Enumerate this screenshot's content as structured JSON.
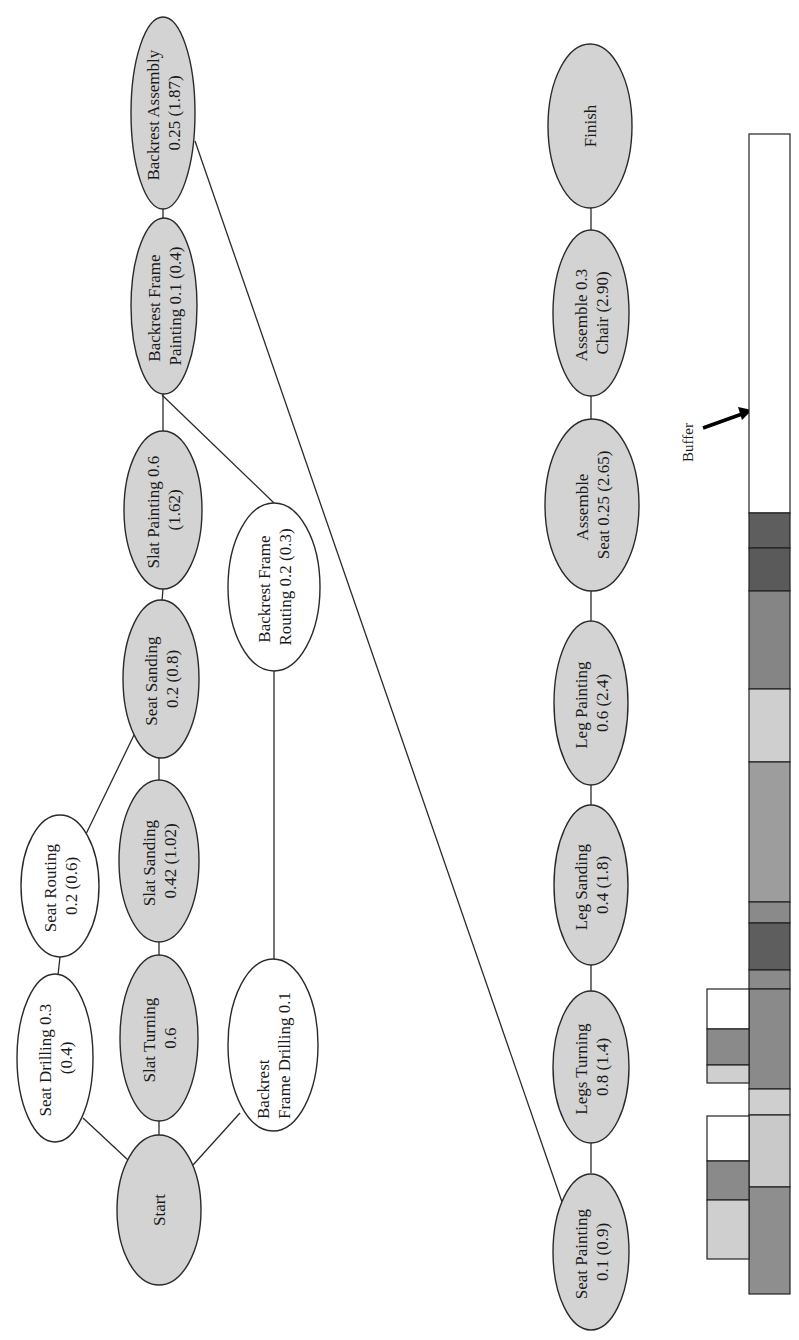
{
  "colors": {
    "critical_node_fill": "#d3d3d3",
    "noncritical_node_fill": "#ffffff",
    "edge": "#2a2a2a",
    "bar_dark": "#5e5e5e",
    "bar_mid": "#8a8a8a",
    "bar_midlight": "#9d9d9d",
    "bar_light": "#cfcfcf",
    "bar_white": "#ffffff"
  },
  "nodes": {
    "start": {
      "lines": [
        "Start"
      ],
      "critical": true
    },
    "seat_drilling": {
      "lines": [
        "Seat Drilling 0.3",
        "(0.4)"
      ],
      "critical": false
    },
    "slat_turning": {
      "lines": [
        "Slat Turning",
        "0.6"
      ],
      "critical": true
    },
    "backrest_frame_drilling": {
      "lines": [
        "Backrest",
        "Frame Drilling 0.1"
      ],
      "critical": false
    },
    "seat_routing": {
      "lines": [
        "Seat Routing",
        "0.2 (0.6)"
      ],
      "critical": false
    },
    "slat_sanding": {
      "lines": [
        "Slat Sanding",
        "0.42 (1.02)"
      ],
      "critical": true
    },
    "seat_sanding": {
      "lines": [
        "Seat Sanding",
        "0.2 (0.8)"
      ],
      "critical": true
    },
    "slat_painting": {
      "lines": [
        "Slat Painting 0.6",
        "(1.62)"
      ],
      "critical": true
    },
    "backrest_frame_routing": {
      "lines": [
        "Backrest Frame",
        "Routing 0.2 (0.3)"
      ],
      "critical": false
    },
    "backrest_frame_painting": {
      "lines": [
        "Backrest Frame",
        "Painting 0.1 (0.4)"
      ],
      "critical": true
    },
    "backrest_assembly": {
      "lines": [
        "Backrest Assembly",
        "0.25 (1.87)"
      ],
      "critical": true
    },
    "seat_painting": {
      "lines": [
        "Seat Painting",
        "0.1 (0.9)"
      ],
      "critical": true
    },
    "legs_turning": {
      "lines": [
        "Legs Turning",
        "0.8 (1.4)"
      ],
      "critical": true
    },
    "leg_sanding": {
      "lines": [
        "Leg Sanding",
        "0.4 (1.8)"
      ],
      "critical": true
    },
    "leg_painting": {
      "lines": [
        "Leg Painting",
        "0.6 (2.4)"
      ],
      "critical": true
    },
    "assemble_seat": {
      "lines": [
        "Assemble",
        "Seat 0.25 (2.65)"
      ],
      "critical": true
    },
    "assemble_chair": {
      "lines": [
        "Assemble 0.3",
        "Chair (2.90)"
      ],
      "critical": true
    },
    "finish": {
      "lines": [
        "Finish"
      ],
      "critical": true
    }
  },
  "edges": [
    [
      "start",
      "seat_drilling"
    ],
    [
      "start",
      "slat_turning"
    ],
    [
      "start",
      "backrest_frame_drilling"
    ],
    [
      "seat_drilling",
      "seat_routing"
    ],
    [
      "seat_routing",
      "seat_sanding"
    ],
    [
      "slat_turning",
      "slat_sanding"
    ],
    [
      "slat_sanding",
      "seat_sanding"
    ],
    [
      "seat_sanding",
      "slat_painting"
    ],
    [
      "slat_painting",
      "backrest_frame_painting"
    ],
    [
      "backrest_frame_drilling",
      "backrest_frame_routing"
    ],
    [
      "backrest_frame_routing",
      "backrest_frame_painting"
    ],
    [
      "backrest_frame_painting",
      "backrest_assembly"
    ],
    [
      "backrest_assembly",
      "seat_painting"
    ],
    [
      "seat_painting",
      "legs_turning"
    ],
    [
      "legs_turning",
      "leg_sanding"
    ],
    [
      "leg_sanding",
      "leg_painting"
    ],
    [
      "leg_painting",
      "assemble_seat"
    ],
    [
      "assemble_seat",
      "assemble_chair"
    ],
    [
      "assemble_chair",
      "finish"
    ]
  ],
  "buffer": {
    "label": "Buffer"
  },
  "buffer_chart": {
    "main_bar_segments": [
      {
        "shade": "white"
      },
      {
        "shade": "dark"
      },
      {
        "shade": "dark"
      },
      {
        "shade": "mid"
      },
      {
        "shade": "light"
      },
      {
        "shade": "midlight"
      },
      {
        "shade": "mid"
      },
      {
        "shade": "dark"
      },
      {
        "shade": "mid"
      },
      {
        "shade": "mid"
      },
      {
        "shade": "light"
      },
      {
        "shade": "light"
      },
      {
        "shade": "mid"
      }
    ],
    "feeding_buffer_1_segments": [
      {
        "shade": "white"
      },
      {
        "shade": "mid"
      },
      {
        "shade": "light"
      }
    ],
    "feeding_buffer_2_segments": [
      {
        "shade": "white"
      },
      {
        "shade": "mid"
      },
      {
        "shade": "light"
      }
    ]
  }
}
